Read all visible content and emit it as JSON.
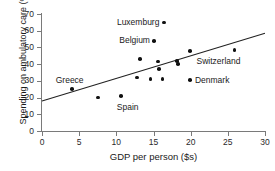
{
  "chart_data": {
    "type": "scatter",
    "title": "",
    "xlabel": "GDP per person ($s)",
    "ylabel": "Spending on ambulatory care (%)",
    "xlim": [
      0,
      30
    ],
    "ylim": [
      0,
      70
    ],
    "xticks": [
      0,
      5,
      10,
      15,
      20,
      25,
      30
    ],
    "yticks": [
      0,
      10,
      20,
      30,
      40,
      50,
      60,
      70
    ],
    "grid": false,
    "legend": "none",
    "points": [
      {
        "label": "Greece",
        "x": 4.0,
        "y": 25.0,
        "label_pos": "above-left"
      },
      {
        "label": "",
        "x": 7.5,
        "y": 20.0,
        "label_pos": "none"
      },
      {
        "label": "Spain",
        "x": 10.6,
        "y": 21.0,
        "label_pos": "below-right"
      },
      {
        "label": "",
        "x": 12.8,
        "y": 32.0,
        "label_pos": "none"
      },
      {
        "label": "",
        "x": 13.2,
        "y": 43.0,
        "label_pos": "none"
      },
      {
        "label": "",
        "x": 14.6,
        "y": 31.0,
        "label_pos": "none"
      },
      {
        "label": "Belgium",
        "x": 15.1,
        "y": 54.0,
        "label_pos": "left"
      },
      {
        "label": "",
        "x": 15.6,
        "y": 41.6,
        "label_pos": "none"
      },
      {
        "label": "",
        "x": 15.7,
        "y": 37.0,
        "label_pos": "none"
      },
      {
        "label": "",
        "x": 16.2,
        "y": 31.0,
        "label_pos": "none"
      },
      {
        "label": "Luxemburg",
        "x": 16.4,
        "y": 65.0,
        "label_pos": "left"
      },
      {
        "label": "",
        "x": 18.2,
        "y": 42.0,
        "label_pos": "none"
      },
      {
        "label": "",
        "x": 18.3,
        "y": 40.0,
        "label_pos": "none"
      },
      {
        "label": "",
        "x": 19.9,
        "y": 48.0,
        "label_pos": "none"
      },
      {
        "label": "Denmark",
        "x": 19.9,
        "y": 30.5,
        "label_pos": "right"
      },
      {
        "label": "Switzerland",
        "x": 25.9,
        "y": 48.5,
        "label_pos": "below-left"
      }
    ],
    "trendline": {
      "x0": 0,
      "y0": 18.0,
      "x1": 30,
      "y1": 58.5
    },
    "colors": {
      "point": "#111111",
      "axis": "#7a7a7a",
      "trendline": "#222222",
      "text": "#1a1a1a",
      "background": "#ffffff"
    }
  }
}
